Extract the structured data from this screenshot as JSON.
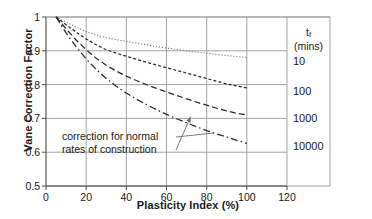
{
  "chart_data": {
    "type": "line",
    "title": "",
    "xlabel": "Plasticity Index (%)",
    "ylabel": "Vane Correction Factor",
    "xlim": [
      0,
      120
    ],
    "ylim": [
      0.5,
      1.0
    ],
    "xticks": [
      "0",
      "20",
      "40",
      "60",
      "80",
      "100",
      "120"
    ],
    "yticks": [
      "0.5",
      "0.6",
      "0.7",
      "0.8",
      "0.9",
      "1"
    ],
    "grid": true,
    "legend_position": "right-panel",
    "legend_title_main": "t",
    "legend_title_sub": "f",
    "legend_title_units": "(mins)",
    "annotation": {
      "line1": "correction for normal",
      "line2": "rates of construction",
      "target_x": 72,
      "target_y": 0.705
    },
    "series": [
      {
        "name": "10",
        "label": "10",
        "style": "dotted",
        "x": [
          5,
          10,
          15,
          20,
          25,
          30,
          35,
          40,
          45,
          50,
          55,
          60,
          65,
          70,
          75,
          80,
          85,
          90,
          95,
          100
        ],
        "y": [
          1.0,
          0.985,
          0.97,
          0.957,
          0.947,
          0.939,
          0.933,
          0.928,
          0.923,
          0.918,
          0.913,
          0.908,
          0.904,
          0.9,
          0.896,
          0.893,
          0.889,
          0.886,
          0.883,
          0.88
        ]
      },
      {
        "name": "100",
        "label": "100",
        "style": "fine-dashed",
        "x": [
          5,
          10,
          15,
          20,
          25,
          30,
          35,
          40,
          45,
          50,
          55,
          60,
          65,
          70,
          75,
          80,
          85,
          90,
          95,
          100
        ],
        "y": [
          1.0,
          0.977,
          0.955,
          0.935,
          0.918,
          0.903,
          0.893,
          0.884,
          0.875,
          0.866,
          0.858,
          0.85,
          0.842,
          0.834,
          0.826,
          0.818,
          0.81,
          0.802,
          0.796,
          0.79
        ]
      },
      {
        "name": "1000",
        "label": "1000",
        "style": "dashed",
        "x": [
          5,
          10,
          15,
          20,
          25,
          30,
          35,
          40,
          45,
          50,
          55,
          60,
          65,
          70,
          75,
          80,
          85,
          90,
          95,
          100
        ],
        "y": [
          1.0,
          0.965,
          0.932,
          0.903,
          0.878,
          0.857,
          0.84,
          0.825,
          0.812,
          0.8,
          0.789,
          0.778,
          0.768,
          0.758,
          0.748,
          0.739,
          0.73,
          0.722,
          0.715,
          0.71
        ]
      },
      {
        "name": "10000",
        "label": "10000",
        "style": "dash-dot",
        "x": [
          5,
          10,
          15,
          20,
          25,
          30,
          35,
          40,
          45,
          50,
          55,
          60,
          65,
          70,
          75,
          80,
          85,
          90,
          95,
          100
        ],
        "y": [
          1.0,
          0.953,
          0.912,
          0.876,
          0.845,
          0.818,
          0.795,
          0.775,
          0.757,
          0.741,
          0.726,
          0.712,
          0.699,
          0.687,
          0.675,
          0.664,
          0.654,
          0.645,
          0.635,
          0.626
        ]
      }
    ]
  }
}
